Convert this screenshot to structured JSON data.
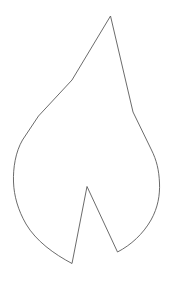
{
  "canvas": {
    "width": 176,
    "height": 283,
    "background_color": "#ffffff",
    "title": "Flame Outline Drawing"
  },
  "shape": {
    "name": "flame-outline",
    "description": "Single closed line-art outline of a flame / leaf silhouette with a V notch at the bottom",
    "stroke_color": "#5a5a5a",
    "stroke_width": 0.9,
    "fill": "none",
    "path": "M 110.5 16 L 72 80 L 38.5 116 L 22.5 140 C 15.5 152 13 168 13.5 182 C 14 196 18 210 26 224 C 36 241 54 254 72 263.5 L 87 186.5 L 117.5 252 C 131 245 143 234 151 220 C 158 207.5 160 195 159.5 183 C 159 170 156.5 160 151.5 150 L 133 112 Z",
    "key_points": [
      {
        "name": "apex-top",
        "x": 110.5,
        "y": 16
      },
      {
        "name": "left-diagonal-mid",
        "x": 38.5,
        "y": 116
      },
      {
        "name": "leftmost-curve",
        "x": 13.5,
        "y": 182
      },
      {
        "name": "bottom-left-point",
        "x": 72,
        "y": 263.5
      },
      {
        "name": "inner-notch-peak",
        "x": 87,
        "y": 186.5
      },
      {
        "name": "bottom-right-vertex",
        "x": 117.5,
        "y": 252
      },
      {
        "name": "rightmost-curve",
        "x": 159.5,
        "y": 183
      }
    ]
  }
}
